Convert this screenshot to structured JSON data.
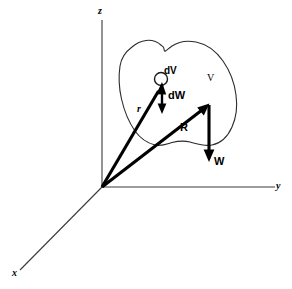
{
  "figure": {
    "type": "vector-diagram",
    "width": 292,
    "height": 289,
    "background_color": "#ffffff",
    "line_color": "#000000",
    "axis_color": "#3a3a3a"
  },
  "axes": [
    {
      "name": "x",
      "label": "x",
      "label_x": 12,
      "label_y": 268,
      "from": [
        102,
        187
      ],
      "to": [
        20,
        270
      ]
    },
    {
      "name": "y",
      "label": "y",
      "label_x": 276,
      "label_y": 181,
      "from": [
        102,
        187
      ],
      "to": [
        275,
        187
      ]
    },
    {
      "name": "z",
      "label": "z",
      "label_x": 98,
      "label_y": 6,
      "from": [
        102,
        187
      ],
      "to": [
        102,
        20
      ]
    }
  ],
  "origin": {
    "x": 102,
    "y": 187
  },
  "region": {
    "label": "V",
    "label_x": 207,
    "label_y": 73,
    "name": "volume-region"
  },
  "element": {
    "label": "dV",
    "label_x": 164,
    "label_y": 66,
    "circle_cx": 161,
    "circle_cy": 79,
    "circle_r": 6.5,
    "name": "differential-volume-element"
  },
  "vectors": [
    {
      "name": "r",
      "label": "r",
      "label_x": 137,
      "label_y": 104,
      "from": [
        102,
        187
      ],
      "to": [
        162,
        83
      ],
      "style": "bold"
    },
    {
      "name": "R",
      "label": "R",
      "label_x": 180,
      "label_y": 122,
      "from": [
        102,
        187
      ],
      "to": [
        209,
        104
      ],
      "style": "bold"
    },
    {
      "name": "dW",
      "label": "dW",
      "label_x": 168,
      "label_y": 90,
      "from": [
        162,
        84
      ],
      "to": [
        162,
        113
      ],
      "style": "thin"
    },
    {
      "name": "W",
      "label": "W",
      "label_x": 214,
      "label_y": 156,
      "from": [
        209,
        105
      ],
      "to": [
        209,
        161
      ],
      "style": "bold"
    }
  ]
}
